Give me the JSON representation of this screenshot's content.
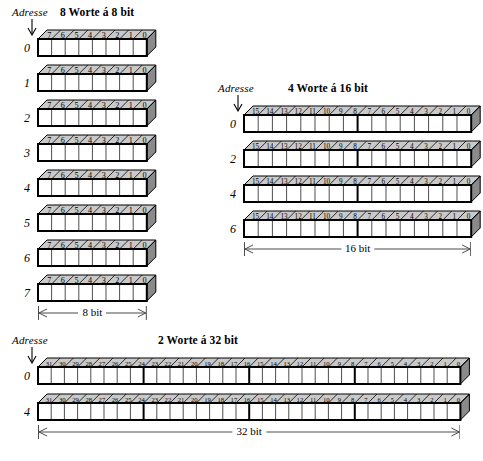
{
  "page": {
    "address_label": "Adresse",
    "colors": {
      "top_face": "#c9c9c9",
      "side_face": "#8a8a8a",
      "cell_fill": "#ffffff",
      "outline": "#000000",
      "dimension_line": "#4a4a4a"
    }
  },
  "groups": [
    {
      "id": "words-8bit",
      "title": "8 Worte á 8 bit",
      "address_label": "Adresse",
      "word_count": 8,
      "bit_width": 8,
      "bit_labels": [
        "7",
        "6",
        "5",
        "4",
        "3",
        "2",
        "1",
        "0"
      ],
      "byte_boundaries": [],
      "addresses": [
        "0",
        "1",
        "2",
        "3",
        "4",
        "5",
        "6",
        "7"
      ],
      "dimension": "8 bit"
    },
    {
      "id": "words-16bit",
      "title": "4 Worte á 16 bit",
      "address_label": "Adresse",
      "word_count": 4,
      "bit_width": 16,
      "bit_labels": [
        "15",
        "14",
        "13",
        "12",
        "11",
        "10",
        "9",
        "8",
        "7",
        "6",
        "5",
        "4",
        "3",
        "2",
        "1",
        "0"
      ],
      "byte_boundaries": [
        8
      ],
      "addresses": [
        "0",
        "2",
        "4",
        "6"
      ],
      "dimension": "16 bit"
    },
    {
      "id": "words-32bit",
      "title": "2 Worte á 32 bit",
      "address_label": "Adresse",
      "word_count": 2,
      "bit_width": 32,
      "bit_labels": [
        "31",
        "30",
        "29",
        "28",
        "27",
        "26",
        "25",
        "24",
        "23",
        "22",
        "21",
        "20",
        "19",
        "18",
        "17",
        "16",
        "15",
        "14",
        "13",
        "12",
        "11",
        "10",
        "9",
        "8",
        "7",
        "6",
        "5",
        "4",
        "3",
        "2",
        "1",
        "0"
      ],
      "byte_boundaries": [
        8,
        16,
        24
      ],
      "addresses": [
        "0",
        "4"
      ],
      "dimension": "32 bit"
    }
  ],
  "layout": {
    "groups": [
      {
        "left": 12,
        "top": 6,
        "cell_w": 13.6,
        "cell_h": 17,
        "row_gap": 35,
        "depth": 9,
        "addr_w": 18,
        "bar_x": 26,
        "title_x": 48,
        "dim_pad_left": 8
      },
      {
        "left": 218,
        "top": 82,
        "cell_w": 14.2,
        "cell_h": 17,
        "row_gap": 35,
        "depth": 9,
        "addr_w": 18,
        "bar_x": 26,
        "title_x": 70,
        "dim_pad_left": 8
      },
      {
        "left": 12,
        "top": 334,
        "cell_w": 13.2,
        "cell_h": 17,
        "row_gap": 36,
        "depth": 9,
        "addr_w": 18,
        "bar_x": 26,
        "title_x": 146,
        "dim_pad_left": 8
      }
    ]
  }
}
